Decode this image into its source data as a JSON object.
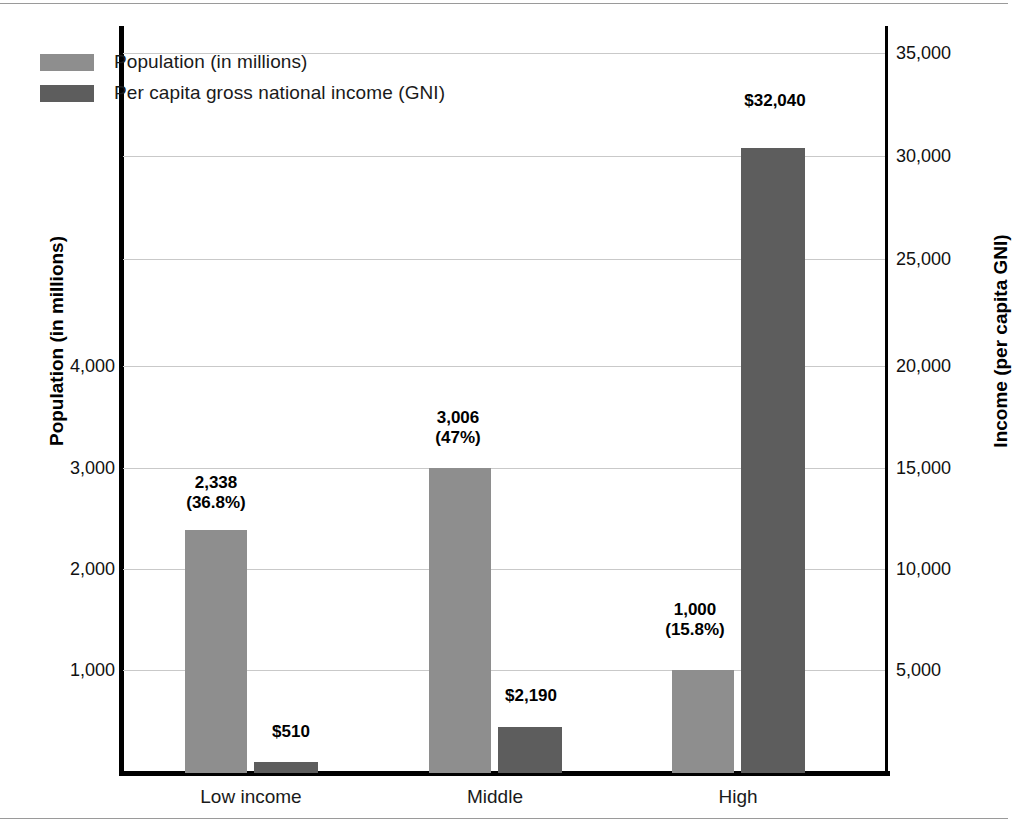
{
  "chart_data": {
    "type": "bar",
    "title": "",
    "categories": [
      "Low income",
      "Middle",
      "High"
    ],
    "series": [
      {
        "name": "Population (in millions)",
        "axis": "left",
        "color": "#8e8e8e",
        "values": [
          2338,
          3006,
          1000
        ],
        "value_labels": [
          "2,338\n(36.8%)",
          "3,006\n(47%)",
          "1,000\n(15.8%)"
        ],
        "percent_labels": [
          "36.8%",
          "47%",
          "15.8%"
        ]
      },
      {
        "name": "Per capita gross national income (GNI)",
        "axis": "right",
        "color": "#5d5d5d",
        "values": [
          510,
          2190,
          32040
        ],
        "value_labels": [
          "$510",
          "$2,190",
          "$32,040"
        ]
      }
    ],
    "xlabel": "",
    "ylabel": "Population (in millions)",
    "y2label": "Income (per capita GNI)",
    "ylim": [
      0,
      7071
    ],
    "y2lim": [
      0,
      37500
    ],
    "left_ticks": [
      "1,000",
      "2,000",
      "3,000",
      "4,000"
    ],
    "left_tick_values": [
      1000,
      2000,
      3000,
      4000
    ],
    "right_ticks": [
      "5,000",
      "10,000",
      "15,000",
      "20,000",
      "25,000",
      "30,000",
      "35,000"
    ],
    "right_tick_values": [
      5000,
      10000,
      15000,
      20000,
      25000,
      30000,
      35000
    ],
    "grid": true,
    "grid_axis": "y",
    "legend_position": "top-left",
    "legend": [
      "Population (in millions)",
      "Per capita gross national income (GNI)"
    ]
  },
  "axes": {
    "left_title": "Population (in millions)",
    "right_title": "Income (per capita GNI)"
  },
  "legend": {
    "items": [
      {
        "label": "Population (in millions)",
        "color": "#8e8e8e"
      },
      {
        "label": "Per capita gross national income (GNI)",
        "color": "#5d5d5d"
      }
    ]
  },
  "ticks": {
    "left": [
      {
        "label": "4,000",
        "y": 366
      },
      {
        "label": "3,000",
        "y": 468
      },
      {
        "label": "2,000",
        "y": 569
      },
      {
        "label": "1,000",
        "y": 670
      }
    ],
    "right": [
      {
        "label": "35,000",
        "y": 53
      },
      {
        "label": "30,000",
        "y": 156
      },
      {
        "label": "25,000",
        "y": 259
      },
      {
        "label": "20,000",
        "y": 366
      },
      {
        "label": "15,000",
        "y": 468
      },
      {
        "label": "10,000",
        "y": 569
      },
      {
        "label": "5,000",
        "y": 670
      }
    ]
  },
  "gridlines": [
    53,
    156,
    259,
    366,
    468,
    569,
    670
  ],
  "bars": [
    {
      "name": "low-population",
      "series": "pop",
      "label": "2,338\n(36.8%)",
      "x": 62,
      "width": 62,
      "height": 243,
      "label_x": 26,
      "label_y": 473
    },
    {
      "name": "low-gni",
      "series": "gni",
      "label": "$510",
      "x": 131,
      "width": 64,
      "height": 11,
      "label_x": 100,
      "label_y": 722
    },
    {
      "name": "middle-population",
      "series": "pop",
      "label": "3,006\n(47%)",
      "x": 306,
      "width": 62,
      "height": 305,
      "label_x": 268,
      "label_y": 408
    },
    {
      "name": "middle-gni",
      "series": "gni",
      "label": "$2,190",
      "x": 375,
      "width": 64,
      "height": 46,
      "label_x": 340,
      "label_y": 686
    },
    {
      "name": "high-population",
      "series": "pop",
      "label": "1,000\n(15.8%)",
      "x": 549,
      "width": 62,
      "height": 103,
      "label_x": 505,
      "label_y": 600
    },
    {
      "name": "high-gni",
      "series": "gni",
      "label": "$32,040",
      "x": 618,
      "width": 64,
      "height": 625,
      "label_x": 584,
      "label_y": 91
    }
  ],
  "categories": [
    {
      "label": "Low income",
      "x": 28
    },
    {
      "label": "Middle",
      "x": 272
    },
    {
      "label": "High",
      "x": 515
    }
  ]
}
